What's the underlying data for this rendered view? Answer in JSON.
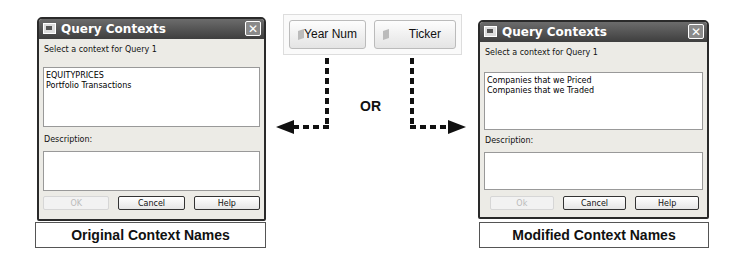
{
  "left_dialog": {
    "title": "Query Contexts",
    "close_glyph": "✕",
    "prompt": "Select a context for Query 1",
    "contexts": [
      "EQUITYPRICES",
      "Portfolio Transactions"
    ],
    "description_label": "Description:",
    "description_value": "",
    "buttons": {
      "ok": "OK",
      "cancel": "Cancel",
      "help": "Help"
    }
  },
  "left_caption": "Original Context Names",
  "center": {
    "objects": [
      {
        "label": "Year Num"
      },
      {
        "label": "Ticker"
      }
    ],
    "or_label": "OR"
  },
  "right_dialog": {
    "title": "Query Contexts",
    "close_glyph": "✕",
    "prompt": "Select a context for Query 1",
    "contexts": [
      "Companies that we Priced",
      "Companies that we Traded"
    ],
    "description_label": "Description:",
    "description_value": "",
    "buttons": {
      "ok": "Ok",
      "cancel": "Cancel",
      "help": "Help"
    }
  },
  "right_caption": "Modified Context Names"
}
